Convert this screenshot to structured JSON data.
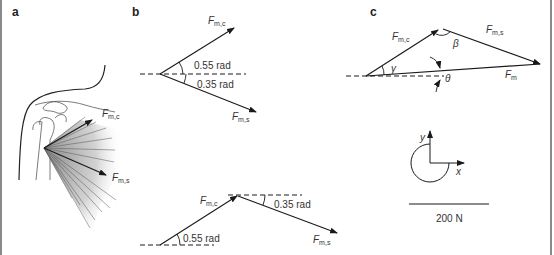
{
  "panels": {
    "a": {
      "label": "a",
      "vectors": [
        {
          "name": "F",
          "sub": "m,c"
        },
        {
          "name": "F",
          "sub": "m,s"
        }
      ]
    },
    "b": {
      "label": "b",
      "top": {
        "vectors": [
          {
            "name": "F",
            "sub": "m,c"
          },
          {
            "name": "F",
            "sub": "m,s"
          }
        ],
        "angles": [
          "0.55 rad",
          "0.35 rad"
        ]
      },
      "bottom": {
        "vectors": [
          {
            "name": "F",
            "sub": "m,c"
          },
          {
            "name": "F",
            "sub": "m,s"
          }
        ],
        "angles": [
          "0.55 rad",
          "0.35 rad"
        ]
      }
    },
    "c": {
      "label": "c",
      "vectors": [
        {
          "name": "F",
          "sub": "m,c"
        },
        {
          "name": "F",
          "sub": "m,s"
        },
        {
          "name": "F",
          "sub": "m"
        }
      ],
      "angles": [
        "γ",
        "β",
        "θ"
      ],
      "axes": {
        "x": "x",
        "y": "y"
      },
      "scale_bar": "200 N"
    }
  },
  "colors": {
    "line": "#1a1a1a",
    "text": "#333333",
    "shade": "#9a9a9a",
    "border": "#8a8a8a"
  }
}
